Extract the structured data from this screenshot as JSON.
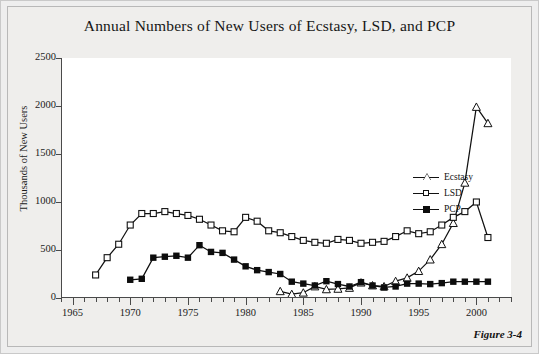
{
  "figure": {
    "caption": "Figure 3-4"
  },
  "chart_data": {
    "type": "line",
    "title": "Annual Numbers of New Users of Ecstasy, LSD, and PCP",
    "xlabel": "",
    "ylabel": "Thousands of New Users",
    "xlim": [
      1964,
      2003
    ],
    "ylim": [
      0,
      2500
    ],
    "yticks": [
      0,
      500,
      1000,
      1500,
      2000,
      2500
    ],
    "ytick_labels": [
      "0",
      "500",
      "1000",
      "1500",
      "2000",
      "2500"
    ],
    "xticks": [
      1965,
      1970,
      1975,
      1980,
      1985,
      1990,
      1995,
      2000
    ],
    "xtick_labels": [
      "1965",
      "1970",
      "1975",
      "1980",
      "1985",
      "1990",
      "1995",
      "2000"
    ],
    "minor_xticks_every": 1,
    "grid": false,
    "legend_position": "right",
    "series": [
      {
        "name": "Ecstasy",
        "marker": "triangle-open",
        "color": "#111111",
        "x": [
          1983,
          1984,
          1985,
          1986,
          1987,
          1988,
          1989,
          1990,
          1991,
          1992,
          1993,
          1994,
          1995,
          1996,
          1997,
          1998,
          1999,
          2000,
          2001
        ],
        "values": [
          70,
          40,
          55,
          120,
          90,
          95,
          105,
          160,
          130,
          120,
          175,
          210,
          280,
          400,
          560,
          780,
          1200,
          1990,
          1820
        ]
      },
      {
        "name": "LSD",
        "marker": "square-open",
        "color": "#111111",
        "x": [
          1967,
          1968,
          1969,
          1970,
          1971,
          1972,
          1973,
          1974,
          1975,
          1976,
          1977,
          1978,
          1979,
          1980,
          1981,
          1982,
          1983,
          1984,
          1985,
          1986,
          1987,
          1988,
          1989,
          1990,
          1991,
          1992,
          1993,
          1994,
          1995,
          1996,
          1997,
          1998,
          1999,
          2000,
          2001
        ],
        "values": [
          240,
          420,
          560,
          760,
          880,
          880,
          900,
          880,
          860,
          820,
          760,
          700,
          690,
          840,
          800,
          700,
          680,
          640,
          600,
          580,
          570,
          610,
          600,
          570,
          580,
          590,
          640,
          700,
          670,
          690,
          760,
          840,
          900,
          1000,
          630
        ]
      },
      {
        "name": "PCP",
        "marker": "square-filled",
        "color": "#0d0d0d",
        "x": [
          1970,
          1971,
          1972,
          1973,
          1974,
          1975,
          1976,
          1977,
          1978,
          1979,
          1980,
          1981,
          1982,
          1983,
          1984,
          1985,
          1986,
          1987,
          1988,
          1989,
          1990,
          1991,
          1992,
          1993,
          1994,
          1995,
          1996,
          1997,
          1998,
          1999,
          2000,
          2001
        ],
        "values": [
          190,
          200,
          420,
          430,
          440,
          420,
          550,
          480,
          470,
          400,
          330,
          290,
          270,
          250,
          170,
          150,
          130,
          175,
          145,
          120,
          165,
          130,
          110,
          120,
          150,
          150,
          145,
          155,
          170,
          170,
          170,
          170
        ]
      }
    ]
  }
}
